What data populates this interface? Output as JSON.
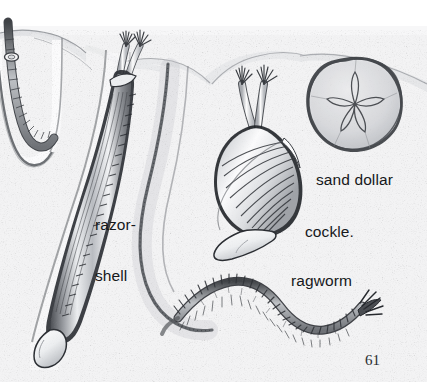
{
  "page": {
    "type": "illustration",
    "page_number": "61",
    "background_color": "#f2f2f3",
    "ink_color": "#16181b"
  },
  "labels": [
    {
      "id": "razor-shell",
      "line1": "razor-",
      "line2": "shell",
      "x": 95,
      "y": 182
    },
    {
      "id": "sand-dollar",
      "text": "sand dollar",
      "x": 316,
      "y": 171
    },
    {
      "id": "cockle",
      "text": "cockle.",
      "x": 305,
      "y": 223
    },
    {
      "id": "ragworm",
      "text": "ragworm",
      "x": 291,
      "y": 272
    }
  ],
  "creatures": [
    {
      "id": "lugworm",
      "name": "lugworm",
      "position": "far-left",
      "form": "segmented worm in U burrow"
    },
    {
      "id": "razor-shell",
      "name": "razor-shell",
      "position": "left",
      "form": "elongated ribbed bivalve in vertical burrow with siphons"
    },
    {
      "id": "cockle",
      "name": "cockle",
      "position": "centre-right",
      "form": "ribbed fan bivalve with paired siphons and foot"
    },
    {
      "id": "sand-dollar",
      "name": "sand dollar",
      "position": "right",
      "form": "round flat urchin with five-petal pattern"
    },
    {
      "id": "ragworm",
      "name": "ragworm",
      "position": "bottom",
      "form": "S-curved bristled segmented worm"
    }
  ]
}
